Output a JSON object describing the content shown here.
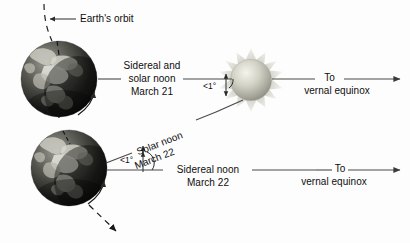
{
  "figure": {
    "background_color": "#fdfdfd",
    "ink_color": "#0d0d0d",
    "line_color": "#4a4a4a"
  },
  "labels": {
    "orbit": "Earth's orbit",
    "sidereal_and_solar_noon_line1": "Sidereal and",
    "sidereal_and_solar_noon_line2": "solar noon",
    "sidereal_and_solar_noon_line3": "March 21",
    "solar_noon_line1": "Solar noon",
    "solar_noon_line2": "March 22",
    "sidereal_noon_line1": "Sidereal noon",
    "sidereal_noon_line2": "March 22",
    "to_vernal_equinox_top_line1": "To",
    "to_vernal_equinox_top_line2": "vernal equinox",
    "to_vernal_equinox_bottom_line1": "To",
    "to_vernal_equinox_bottom_line2": "vernal equinox",
    "angle_top": "<1°",
    "angle_bottom": "<1°"
  },
  "objects": {
    "earth_top": "earth-globe-march-21",
    "earth_bottom": "earth-globe-march-22",
    "sun": "sun-with-corona",
    "orbit_path": "dashed-orbit-path",
    "rotation_arrow_top": "earth-rotation-arrow",
    "rotation_arrow_bottom": "earth-rotation-arrow",
    "orbit_direction_arrow": "orbit-direction-arrow"
  },
  "colors": {
    "earth_land": "#e8e8e4",
    "earth_ocean": "#1e1e1e",
    "earth_shadow": "#0a0a0a",
    "sun_core": "#efefe6",
    "sun_mid": "#b9b9ad",
    "sun_corona": "#c9c9bd",
    "line": "#4a4a4a",
    "dash": "#2a2a2a"
  }
}
